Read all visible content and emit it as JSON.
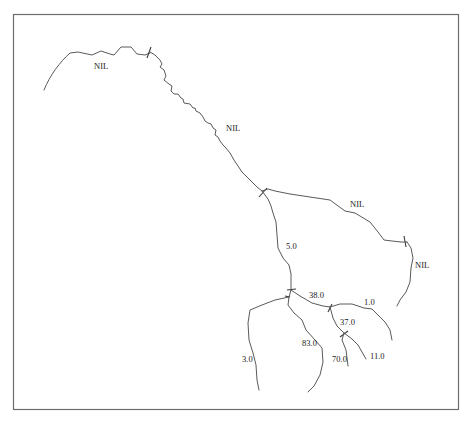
{
  "diagram": {
    "type": "river-network",
    "frame": {
      "x": 13,
      "y": 14,
      "width": 446,
      "height": 396,
      "stroke": "#6e6e6e"
    },
    "line_color": "#5a5a5a",
    "labels": [
      {
        "id": "nil-1",
        "text": "NIL",
        "x": 94,
        "y": 69
      },
      {
        "id": "nil-2",
        "text": "NIL",
        "x": 226,
        "y": 131
      },
      {
        "id": "nil-3",
        "text": "NIL",
        "x": 350,
        "y": 207
      },
      {
        "id": "nil-4",
        "text": "NIL",
        "x": 415,
        "y": 268
      },
      {
        "id": "val-5",
        "text": "5.0",
        "x": 286,
        "y": 249
      },
      {
        "id": "val-38",
        "text": "38.0",
        "x": 309,
        "y": 298
      },
      {
        "id": "val-1",
        "text": "1.0",
        "x": 364,
        "y": 305
      },
      {
        "id": "val-37",
        "text": "37.0",
        "x": 340,
        "y": 325
      },
      {
        "id": "val-83",
        "text": "83.0",
        "x": 302,
        "y": 346
      },
      {
        "id": "val-70",
        "text": "70.0",
        "x": 332,
        "y": 362
      },
      {
        "id": "val-11",
        "text": "11.0",
        "x": 370,
        "y": 359
      },
      {
        "id": "val-3",
        "text": "3.0",
        "x": 242,
        "y": 362
      }
    ]
  }
}
